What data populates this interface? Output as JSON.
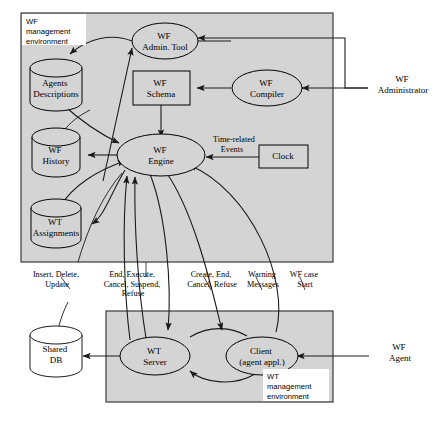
{
  "diagram": {
    "colors": {
      "panel_fill": "#d4d4d4",
      "shape_fill": "#d4d4d4",
      "stroke": "#1a1a1a",
      "label_bg": "#ffffff"
    },
    "panels": [
      {
        "id": "wf-env",
        "label_lines": [
          "WF",
          "management",
          "environment"
        ]
      },
      {
        "id": "wt-env",
        "label_lines": [
          "WT",
          "management",
          "environment"
        ]
      }
    ],
    "nodes": {
      "wf_admin_tool": {
        "lines": [
          "WF",
          "Admin. Tool"
        ],
        "shape": "ellipse"
      },
      "wf_schema": {
        "lines": [
          "WF",
          "Schema"
        ],
        "shape": "rect"
      },
      "wf_compiler": {
        "lines": [
          "WF",
          "Compiler"
        ],
        "shape": "ellipse"
      },
      "agents_descriptions": {
        "lines": [
          "Agents",
          "Descriptions"
        ],
        "shape": "cylinder"
      },
      "wf_history": {
        "lines": [
          "WF",
          "History"
        ],
        "shape": "cylinder"
      },
      "wt_assignments": {
        "lines": [
          "WT",
          "Assignments"
        ],
        "shape": "cylinder"
      },
      "wf_engine": {
        "lines": [
          "WF",
          "Engine"
        ],
        "shape": "ellipse"
      },
      "clock": {
        "lines": [
          "Clock"
        ],
        "shape": "rect"
      },
      "shared_db": {
        "lines": [
          "Shared",
          "DB"
        ],
        "shape": "cylinder"
      },
      "wt_server": {
        "lines": [
          "WT",
          "Server"
        ],
        "shape": "ellipse"
      },
      "client": {
        "lines": [
          "Client",
          "(agent appl.)"
        ],
        "shape": "ellipse"
      }
    },
    "actors": [
      {
        "id": "wf-administrator",
        "lines": [
          "WF",
          "Administrator"
        ]
      },
      {
        "id": "wf-agent",
        "lines": [
          "WF",
          "Agent"
        ]
      }
    ],
    "edge_labels": [
      {
        "id": "time-related-events",
        "lines": [
          "Time-related",
          "Events"
        ]
      },
      {
        "id": "insert-delete-update",
        "lines": [
          "Insert, Delete,",
          "Update"
        ]
      },
      {
        "id": "end-execute-cancel-suspend-refuse",
        "lines": [
          "End, Execute,",
          "Cancel, Suspend,",
          "Refuse"
        ]
      },
      {
        "id": "create-end-cancel-refuse",
        "lines": [
          "Create, End,",
          "Cancel, Refuse"
        ]
      },
      {
        "id": "warning-messages",
        "lines": [
          "Warning",
          "Messages"
        ]
      },
      {
        "id": "wf-case-start",
        "lines": [
          "WF case",
          "Start"
        ]
      }
    ]
  }
}
